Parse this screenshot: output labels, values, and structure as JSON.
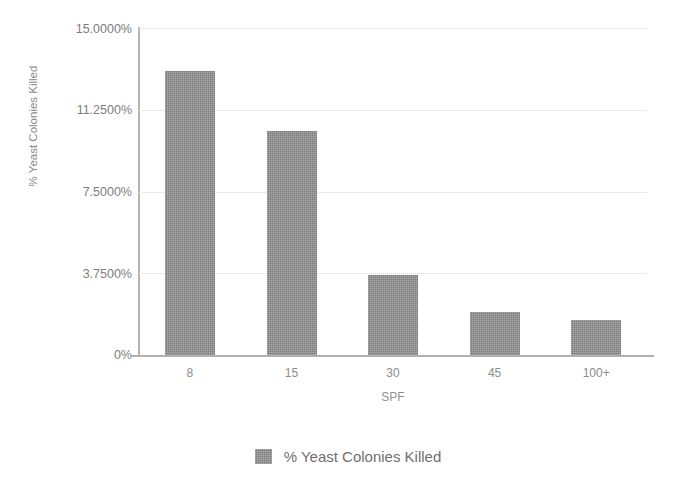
{
  "chart_data": {
    "type": "bar",
    "title": "",
    "categories": [
      "8",
      "15",
      "30",
      "45",
      "100+"
    ],
    "values": [
      13.02,
      10.29,
      3.69,
      1.98,
      1.62
    ],
    "series": [
      {
        "name": "% Yeast Colonies Killed",
        "values": [
          13.02,
          10.29,
          3.69,
          1.98,
          1.62
        ],
        "color": "#7e7e7e"
      }
    ],
    "xlabel": "SPF",
    "ylabel": "% Yeast Colonies Killed",
    "ylim": [
      0,
      15
    ],
    "yticks": [
      0,
      3.75,
      7.5,
      11.25,
      15
    ],
    "ytick_labels": [
      "0%",
      "3.7500%",
      "7.5000%",
      "11.2500%",
      "15.0000%"
    ],
    "grid": true,
    "legend": [
      "% Yeast Colonies Killed"
    ],
    "legend_position": "bottom"
  },
  "axes": {
    "y_title": "% Yeast Colonies Killed",
    "x_title": "SPF",
    "y_ticks": [
      {
        "label": "15.0000%",
        "value": 15
      },
      {
        "label": "11.2500%",
        "value": 11.25
      },
      {
        "label": "7.5000%",
        "value": 7.5
      },
      {
        "label": "3.7500%",
        "value": 3.75
      },
      {
        "label": "0%",
        "value": 0
      }
    ],
    "x_ticks": [
      {
        "label": "8"
      },
      {
        "label": "15"
      },
      {
        "label": "30"
      },
      {
        "label": "45"
      },
      {
        "label": "100+"
      }
    ]
  },
  "legend": {
    "entries": [
      {
        "label": "% Yeast Colonies Killed",
        "color": "#7e7e7e"
      }
    ]
  },
  "colors": {
    "bar": "#7e7e7e",
    "grid": "#e9e9e9",
    "axis": "#b0b0b0",
    "text": "#7d7d7d",
    "background": "#ffffff"
  }
}
